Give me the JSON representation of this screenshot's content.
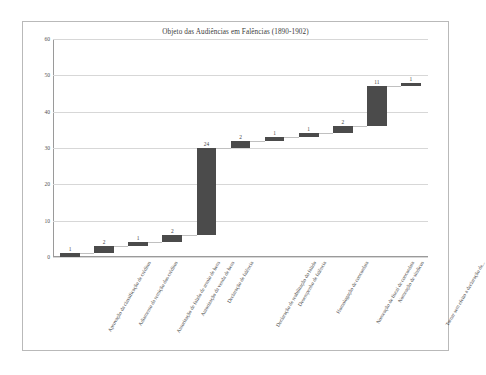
{
  "chart_data": {
    "type": "bar",
    "subtype": "waterfall",
    "title": "Objeto das Audiências em Falências (1890-1902)",
    "xlabel": "",
    "ylabel": "",
    "ylim": [
      0,
      60
    ],
    "yticks": [
      0,
      10,
      20,
      30,
      40,
      50,
      60
    ],
    "ytick_labels": [
      "0",
      "10",
      "20",
      "30",
      "40",
      "50",
      "60"
    ],
    "grid": true,
    "legend": "none",
    "bar_color": "#4b4b4b",
    "categories": [
      "Aprovação da classificação de créditos",
      "Adiamento da remição dos créditos",
      "Autorização de falido de arrolo de bens",
      "Autorização da venda de bens",
      "Declaração de falência",
      "Declaração de reabilitação do falido",
      "Desempenho de falência",
      "Homologação de concordata",
      "Nomeação de fiscal de concordata",
      "Nomeação de síndicos",
      "Tornar sem efeito a declaração de..."
    ],
    "values": [
      1,
      2,
      1,
      2,
      24,
      2,
      1,
      1,
      2,
      11,
      1
    ],
    "data_labels": [
      "1",
      "2",
      "1",
      "2",
      "24",
      "2",
      "1",
      "1",
      "2",
      "11",
      "1"
    ],
    "cumulative_start": [
      0,
      1,
      3,
      4,
      6,
      30,
      32,
      33,
      34,
      36,
      47
    ],
    "cumulative_end": [
      1,
      3,
      4,
      6,
      30,
      32,
      33,
      34,
      36,
      47,
      48
    ],
    "total": 48
  }
}
